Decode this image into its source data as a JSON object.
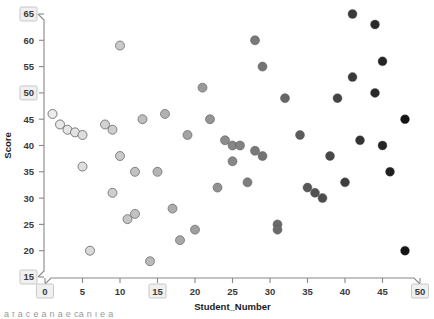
{
  "chart_data": {
    "type": "scatter",
    "title": "",
    "xlabel": "Student_Number",
    "ylabel": "Score",
    "xlim": [
      0,
      50
    ],
    "ylim": [
      15,
      65
    ],
    "xticks": [
      0,
      5,
      10,
      15,
      20,
      25,
      30,
      35,
      40,
      45,
      50
    ],
    "yticks": [
      15,
      20,
      25,
      30,
      35,
      40,
      45,
      50,
      55,
      60,
      65
    ],
    "xtick_labels": [
      "0",
      "5",
      "10",
      "15",
      "20",
      "25",
      "30",
      "35",
      "40",
      "45",
      "50"
    ],
    "ytick_labels": [
      "15",
      "20",
      "25",
      "30",
      "35",
      "40",
      "45",
      "50",
      "55",
      "60",
      "65"
    ],
    "boxed_tick_labels": [
      "65",
      "15",
      "0",
      "50"
    ],
    "grid": false,
    "legend": false,
    "marker_colormap": "grayscale_by_x_light_to_dark",
    "marker_edge_color": "#555555",
    "marker_size_px": 9,
    "points": [
      {
        "x": 1,
        "y": 46
      },
      {
        "x": 2,
        "y": 44
      },
      {
        "x": 3,
        "y": 43
      },
      {
        "x": 4,
        "y": 42.5
      },
      {
        "x": 5,
        "y": 42
      },
      {
        "x": 5,
        "y": 36
      },
      {
        "x": 6,
        "y": 20
      },
      {
        "x": 8,
        "y": 44
      },
      {
        "x": 9,
        "y": 43
      },
      {
        "x": 9,
        "y": 31
      },
      {
        "x": 10,
        "y": 59
      },
      {
        "x": 10,
        "y": 38
      },
      {
        "x": 11,
        "y": 26
      },
      {
        "x": 12,
        "y": 35
      },
      {
        "x": 12,
        "y": 27
      },
      {
        "x": 13,
        "y": 45
      },
      {
        "x": 14,
        "y": 18
      },
      {
        "x": 15,
        "y": 35
      },
      {
        "x": 16,
        "y": 46
      },
      {
        "x": 17,
        "y": 28
      },
      {
        "x": 18,
        "y": 22
      },
      {
        "x": 19,
        "y": 42
      },
      {
        "x": 20,
        "y": 24
      },
      {
        "x": 21,
        "y": 51
      },
      {
        "x": 22,
        "y": 45
      },
      {
        "x": 23,
        "y": 32
      },
      {
        "x": 24,
        "y": 41
      },
      {
        "x": 25,
        "y": 37
      },
      {
        "x": 25,
        "y": 40
      },
      {
        "x": 26,
        "y": 40
      },
      {
        "x": 27,
        "y": 33
      },
      {
        "x": 28,
        "y": 39
      },
      {
        "x": 28,
        "y": 60
      },
      {
        "x": 29,
        "y": 38
      },
      {
        "x": 29,
        "y": 55
      },
      {
        "x": 31,
        "y": 25
      },
      {
        "x": 31,
        "y": 24
      },
      {
        "x": 32,
        "y": 49
      },
      {
        "x": 34,
        "y": 42
      },
      {
        "x": 35,
        "y": 32
      },
      {
        "x": 36,
        "y": 31
      },
      {
        "x": 37,
        "y": 30
      },
      {
        "x": 38,
        "y": 38
      },
      {
        "x": 39,
        "y": 49
      },
      {
        "x": 40,
        "y": 33
      },
      {
        "x": 41,
        "y": 65
      },
      {
        "x": 41,
        "y": 53
      },
      {
        "x": 42,
        "y": 41
      },
      {
        "x": 44,
        "y": 63
      },
      {
        "x": 44,
        "y": 50
      },
      {
        "x": 45,
        "y": 56
      },
      {
        "x": 45,
        "y": 40
      },
      {
        "x": 46,
        "y": 35
      },
      {
        "x": 48,
        "y": 45
      },
      {
        "x": 48,
        "y": 20
      }
    ]
  },
  "footer": {
    "clipped_text": "a f   a   c  e  a     n  a     e   ca         n       l    e  a"
  }
}
